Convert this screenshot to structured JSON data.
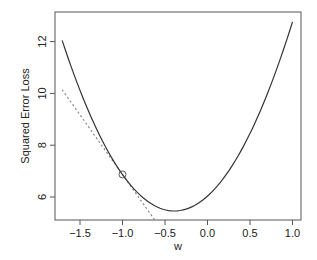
{
  "chart_data": {
    "type": "line",
    "title": "",
    "xlabel": "w",
    "ylabel": "Squared Error Loss",
    "xlim": [
      -1.8,
      1.1
    ],
    "ylim": [
      5.11,
      13.3
    ],
    "xticks": [
      -1.5,
      -1.0,
      -0.5,
      0.0,
      0.5,
      1.0
    ],
    "xtick_labels": [
      "−1.5",
      "−1.0",
      "−0.5",
      "0.0",
      "0.5",
      "1.0"
    ],
    "yticks": [
      6,
      8,
      10,
      12
    ],
    "ytick_labels": [
      "6",
      "8",
      "10",
      "12"
    ],
    "grid": false,
    "legend": null,
    "series": [
      {
        "name": "loss curve",
        "style": "solid",
        "color": "#333333",
        "x": [
          -1.71,
          -1.5,
          -1.25,
          -1.0,
          -0.75,
          -0.5,
          -0.39,
          -0.25,
          0.0,
          0.25,
          0.5,
          0.75,
          1.0
        ],
        "values": [
          12.0,
          10.46,
          8.81,
          6.87,
          5.95,
          5.51,
          5.46,
          5.53,
          6.03,
          7.04,
          8.45,
          10.4,
          12.83
        ]
      },
      {
        "name": "tangent at w = -1.0",
        "style": "dotted",
        "color": "#888888",
        "x": [
          -1.71,
          -0.62
        ],
        "values": [
          10.14,
          5.11
        ]
      }
    ],
    "annotations": [
      {
        "type": "open-circle",
        "x": -1.0,
        "y": 6.87,
        "label": "tangent point"
      }
    ],
    "model": {
      "center": -0.39,
      "min": 5.46,
      "curvature": 3.78,
      "tangent_slope": -4.61
    }
  },
  "colors": {
    "curve": "#333333",
    "tangent": "#888888",
    "axis": "#555555",
    "text": "#222222"
  }
}
